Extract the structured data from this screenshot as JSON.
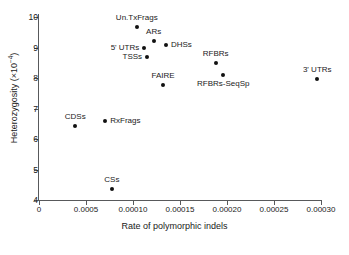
{
  "chart_data": {
    "type": "scatter",
    "title": "",
    "xlabel": "Rate of polymorphic indels",
    "ylabel": "Heterozygosity (×10",
    "ylabel_exponent": "−4",
    "ylabel_tail": ")",
    "xlim": [
      0,
      0.0003
    ],
    "ylim": [
      4,
      10
    ],
    "grid": false,
    "legend": "none",
    "xticks": [
      0,
      5e-05,
      0.0001,
      0.00015,
      0.0002,
      0.00025,
      0.0003
    ],
    "xtick_labels": [
      "0",
      "0.0005",
      "0.00010",
      "0.00015",
      "0.00020",
      "0.00025",
      "0.00030"
    ],
    "yticks": [
      4,
      5,
      6,
      7,
      8,
      9,
      10
    ],
    "ytick_labels": [
      "4",
      "5",
      "6",
      "7",
      "8",
      "9",
      "10"
    ],
    "point_color": "#111111",
    "axis_color": "#58595b",
    "points": [
      {
        "label": "Un.TxFrags",
        "x": 0.000104,
        "y": 9.68,
        "label_pos": "above"
      },
      {
        "label": "ARs",
        "x": 0.000122,
        "y": 9.2,
        "label_pos": "above"
      },
      {
        "label": "5' UTRs",
        "x": 0.000112,
        "y": 9.0,
        "label_pos": "left"
      },
      {
        "label": "DHSs",
        "x": 0.000135,
        "y": 9.08,
        "label_pos": "right"
      },
      {
        "label": "TSSs",
        "x": 0.000115,
        "y": 8.7,
        "label_pos": "left"
      },
      {
        "label": "FAIRE",
        "x": 0.000132,
        "y": 7.78,
        "label_pos": "above"
      },
      {
        "label": "RFBRs",
        "x": 0.000188,
        "y": 8.48,
        "label_pos": "above"
      },
      {
        "label": "RFBRs-SeqSp",
        "x": 0.000196,
        "y": 8.1,
        "label_pos": "below"
      },
      {
        "label": "3' UTRs",
        "x": 0.000296,
        "y": 7.97,
        "label_pos": "above"
      },
      {
        "label": "CDSs",
        "x": 3.85e-05,
        "y": 6.42,
        "label_pos": "above"
      },
      {
        "label": "RxFrags",
        "x": 7.05e-05,
        "y": 6.58,
        "label_pos": "right"
      },
      {
        "label": "CSs",
        "x": 7.75e-05,
        "y": 4.35,
        "label_pos": "above"
      }
    ]
  }
}
